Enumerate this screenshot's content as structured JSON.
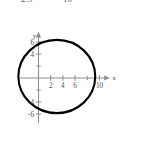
{
  "figure": {
    "name": "ellipse-coordinate-graph",
    "background_color": "#ffffff",
    "curve_color": "#000000",
    "axis_color": "#8c8c8c",
    "label_color": "#4d4d4d",
    "width": 143,
    "height": 143
  },
  "clipped_header": {
    "left_text": "2.5",
    "right_text": "10"
  },
  "axis_labels": {
    "x": "x",
    "y": "y"
  },
  "chart_data": {
    "type": "line",
    "title": "",
    "subtitle": "",
    "xlabel": "x",
    "ylabel": "y",
    "grid": false,
    "legend": "none",
    "xlim": [
      -3,
      11.5
    ],
    "ylim": [
      -7.5,
      7.5
    ],
    "x_ticks": [
      2,
      4,
      6,
      10
    ],
    "x_tick_labels": [
      "2",
      "4",
      "6",
      "10"
    ],
    "x_minor_ticks": [
      8
    ],
    "y_ticks": [
      -6,
      -4,
      4,
      6
    ],
    "y_tick_labels": [
      "-6",
      "-4",
      "4",
      "6"
    ],
    "y_minor_ticks": [
      -2,
      2
    ],
    "series": [
      {
        "name": "ellipse",
        "shape": "ellipse",
        "center_x": 3,
        "center_y": 0.25,
        "semi_axis_x": 6.3,
        "semi_axis_y": 6.1,
        "x_intercepts": [
          -3.3,
          9.3
        ],
        "y_extent": [
          -5.85,
          6.35
        ],
        "closed": true,
        "color": "#000000",
        "line_width": 2.1
      }
    ],
    "annotations": []
  }
}
